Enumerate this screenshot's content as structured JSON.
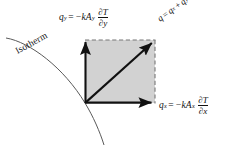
{
  "figure": {
    "background_color": "#ffffff",
    "square_fill_color": "#d2d2d2",
    "line_color": "#111111"
  },
  "labels": {
    "isotherm": "Isotherm",
    "qy": {
      "lhs_var": "q",
      "lhs_sub": "y",
      "equals": "=",
      "coef": "−kA",
      "coef_sub": "y",
      "frac_num": "∂T",
      "frac_den": "∂y"
    },
    "qx": {
      "lhs_var": "q",
      "lhs_sub": "x",
      "equals": "=",
      "coef": "−kA",
      "coef_sub": "x",
      "frac_num": "∂T",
      "frac_den": "∂x"
    },
    "qsum": {
      "lhs_var": "q",
      "equals": "=",
      "term1_var": "q",
      "term1_sub": "x",
      "plus": "+",
      "term2_var": "q",
      "term2_sub": "y"
    }
  },
  "geometry": {
    "origin_x": 85,
    "origin_y": 103,
    "top_y": 40,
    "right_x": 155,
    "arrow_qy_label": "vertical heat flux arrow",
    "arrow_qx_label": "horizontal heat flux arrow",
    "arrow_q_label": "resultant diagonal heat flux arrow",
    "dashed_edges": "top and right",
    "solid_edges": "left and bottom"
  }
}
